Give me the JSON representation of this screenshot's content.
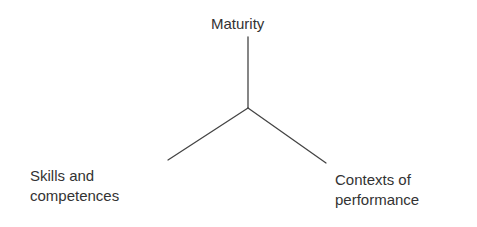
{
  "diagram": {
    "type": "three-axis-branch",
    "colors": {
      "background": "#ffffff",
      "text": "#333333",
      "line": "#444444"
    },
    "junction": {
      "x": 248,
      "y": 108
    },
    "nodes": {
      "top": {
        "lines": [
          "Maturity"
        ],
        "axis_end": {
          "x": 248,
          "y": 37
        }
      },
      "left": {
        "lines": [
          "Skills and",
          "competences"
        ],
        "axis_end": {
          "x": 168,
          "y": 160
        }
      },
      "right": {
        "lines": [
          "Contexts of",
          "performance"
        ],
        "axis_end": {
          "x": 326,
          "y": 163
        }
      }
    }
  }
}
